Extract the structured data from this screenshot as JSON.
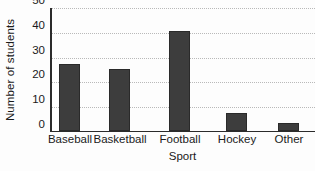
{
  "chart_data": {
    "type": "bar",
    "title": "",
    "subtitle": "",
    "xlabel": "Sport",
    "ylabel": "Number of students",
    "categories": [
      "Baseball",
      "Basketball",
      "Football",
      "Hockey",
      "Other"
    ],
    "values": [
      27,
      25,
      40,
      7,
      3
    ],
    "series": [
      {
        "name": "Number of students",
        "values": [
          27,
          25,
          40,
          7,
          3
        ]
      }
    ],
    "ylim": [
      0,
      50
    ],
    "yticks": [
      0,
      10,
      20,
      30,
      40,
      50
    ],
    "ytick_labels": [
      "0",
      "10",
      "20",
      "30",
      "40",
      "50"
    ],
    "xtick_labels": [
      "Baseball",
      "Basketball",
      "Football",
      "Hockey",
      "Other"
    ],
    "grid": "horizontal-dotted",
    "legend": "none",
    "legend_position": "none",
    "annotations": [],
    "colors": {
      "bar_fill": "#3d3d3d",
      "bar_edge": "#2a2a2a",
      "axis": "#2b2b2b",
      "gridline": "#b9b9b9",
      "background": "#fdfdfd",
      "text": "#1a1a1a"
    }
  },
  "axes": {
    "y_title": "Number of students",
    "x_title": "Sport",
    "y_ticks": [
      {
        "label": "50",
        "value": 50
      },
      {
        "label": "40",
        "value": 40
      },
      {
        "label": "30",
        "value": 30
      },
      {
        "label": "20",
        "value": 20
      },
      {
        "label": "10",
        "value": 10
      },
      {
        "label": "0",
        "value": 0
      }
    ],
    "x_ticks": [
      {
        "label": "Baseball"
      },
      {
        "label": "Basketball"
      },
      {
        "label": "Football"
      },
      {
        "label": "Hockey"
      },
      {
        "label": "Other"
      }
    ]
  }
}
